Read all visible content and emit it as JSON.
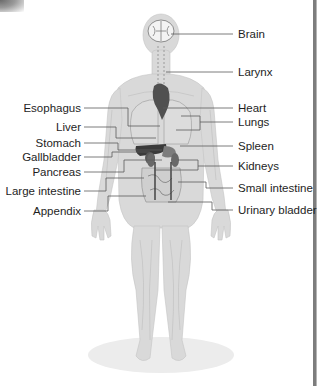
{
  "diagram": {
    "title": "",
    "labels_left": [
      {
        "text": "Esophagus",
        "y": 102
      },
      {
        "text": "Liver",
        "y": 121
      },
      {
        "text": "Stomach",
        "y": 137
      },
      {
        "text": "Gallbladder",
        "y": 151
      },
      {
        "text": "Pancreas",
        "y": 166
      },
      {
        "text": "Large intestine",
        "y": 185
      },
      {
        "text": "Appendix",
        "y": 205
      }
    ],
    "labels_right": [
      {
        "text": "Brain",
        "y": 28
      },
      {
        "text": "Larynx",
        "y": 66
      },
      {
        "text": "Heart",
        "y": 102
      },
      {
        "text": "Lungs",
        "y": 116
      },
      {
        "text": "Spleen",
        "y": 140
      },
      {
        "text": "Kidneys",
        "y": 160
      },
      {
        "text": "Small intestine",
        "y": 182
      },
      {
        "text": "Urinary bladder",
        "y": 204
      }
    ],
    "colors": {
      "body": "#d6d6d6",
      "organ_dark": "#3a3a3a",
      "organ_mid": "#7a7a7a",
      "leader_line": "#555555",
      "floor": "#ececec"
    }
  }
}
